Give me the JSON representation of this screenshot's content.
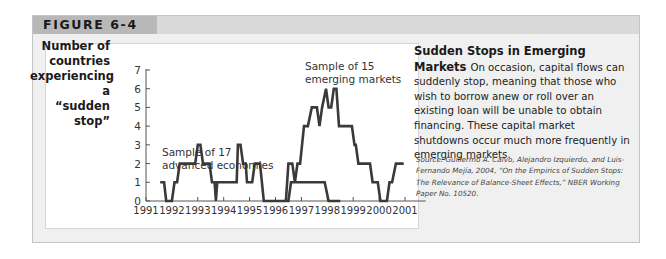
{
  "figure": {
    "label": "FIGURE 6-4"
  },
  "caption": {
    "title": "Sudden Stops in Emerging Markets",
    "body": "On occasion, capital flows can suddenly stop, meaning that those who wish to borrow anew or roll over an existing loan will be unable to obtain financing. These capital market shutdowns occur much more frequently in emerging markets.",
    "source": "Source: Guillermo A. Calvo, Alejandro Izquierdo, and Luis-Fernando Mejía, 2004, “On the Empirics of Sudden Stops: The Relevance of Balance-Sheet Effects,” NBER Working Paper No. 10520."
  },
  "colors": {
    "line": "#3a3a3a",
    "axis": "#555555",
    "frame_bg": "#f0f0f0",
    "header_dark": "#b8b8b8",
    "header_light": "#d9d9d9"
  },
  "chart_data": {
    "type": "line",
    "title": "",
    "xlabel": "",
    "ylabel": "Number of countries experiencing a “sudden stop”",
    "ylabel_lines": [
      "Number of",
      "countries",
      "experiencing a",
      "“sudden stop”"
    ],
    "xlim": [
      1991,
      2001.8
    ],
    "ylim": [
      0,
      7
    ],
    "x_ticks": [
      1991,
      1992,
      1993,
      1994,
      1995,
      1996,
      1997,
      1998,
      1999,
      2000,
      2001
    ],
    "y_ticks": [
      0,
      1,
      2,
      3,
      4,
      5,
      6,
      7
    ],
    "grid": false,
    "series": [
      {
        "name": "Sample of 17 advanced economies",
        "annotation": [
          "Sample of 17",
          "advanced economies"
        ],
        "points": [
          [
            1991.55,
            1
          ],
          [
            1991.7,
            1
          ],
          [
            1991.78,
            0
          ],
          [
            1992.0,
            0
          ],
          [
            1992.1,
            1
          ],
          [
            1992.2,
            1
          ],
          [
            1992.3,
            2
          ],
          [
            1992.9,
            2
          ],
          [
            1993.0,
            3
          ],
          [
            1993.1,
            3
          ],
          [
            1993.2,
            2
          ],
          [
            1993.45,
            2
          ],
          [
            1993.55,
            1
          ],
          [
            1993.65,
            1
          ],
          [
            1993.7,
            0
          ],
          [
            1993.75,
            1
          ],
          [
            1994.5,
            1
          ],
          [
            1994.55,
            3
          ],
          [
            1994.65,
            3
          ],
          [
            1994.75,
            2
          ],
          [
            1994.85,
            2
          ],
          [
            1994.9,
            1
          ],
          [
            1995.1,
            1
          ],
          [
            1995.2,
            2
          ],
          [
            1995.4,
            2
          ],
          [
            1995.55,
            0
          ],
          [
            1996.5,
            0
          ],
          [
            1996.6,
            1
          ],
          [
            1997.9,
            1
          ],
          [
            1998.05,
            0
          ],
          [
            1998.5,
            0
          ]
        ]
      },
      {
        "name": "Sample of 15 emerging markets",
        "annotation": [
          "Sample of 15",
          "emerging markets"
        ],
        "points": [
          [
            1996.4,
            0
          ],
          [
            1996.5,
            2
          ],
          [
            1996.65,
            2
          ],
          [
            1996.75,
            1
          ],
          [
            1996.85,
            2
          ],
          [
            1996.95,
            2
          ],
          [
            1997.1,
            4
          ],
          [
            1997.25,
            4
          ],
          [
            1997.4,
            5
          ],
          [
            1997.6,
            5
          ],
          [
            1997.7,
            4
          ],
          [
            1997.8,
            5
          ],
          [
            1997.95,
            6
          ],
          [
            1998.05,
            5
          ],
          [
            1998.15,
            5
          ],
          [
            1998.25,
            6
          ],
          [
            1998.35,
            6
          ],
          [
            1998.45,
            4
          ],
          [
            1998.95,
            4
          ],
          [
            1999.05,
            3
          ],
          [
            1999.1,
            3
          ],
          [
            1999.2,
            2
          ],
          [
            1999.65,
            2
          ],
          [
            1999.75,
            1
          ],
          [
            1999.95,
            1
          ],
          [
            2000.05,
            0
          ],
          [
            2000.3,
            0
          ],
          [
            2000.4,
            1
          ],
          [
            2000.5,
            1
          ],
          [
            2000.65,
            2
          ],
          [
            2000.95,
            2
          ]
        ]
      }
    ]
  }
}
